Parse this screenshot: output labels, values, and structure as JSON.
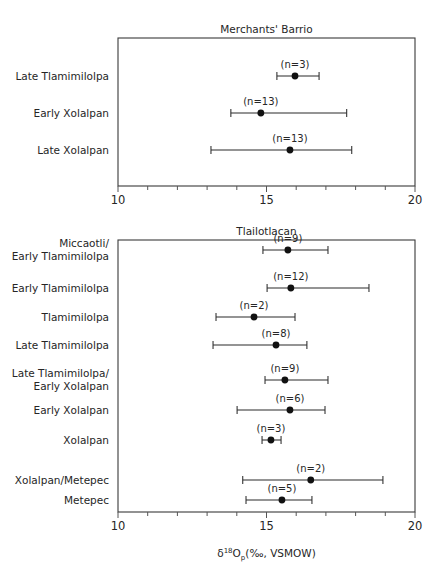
{
  "figure": {
    "axis_title_main": "O",
    "axis_title_delta": "δ",
    "axis_title_sup": "18",
    "axis_title_sub": "p",
    "axis_title_tail": "(‰, VSMOW)"
  },
  "chart_data": {
    "type": "scatter",
    "title": "",
    "xlabel": "δ18Op(‰, VSMOW)",
    "ylabel": "",
    "xlim": [
      10,
      20
    ],
    "xticks": [
      10,
      15,
      20
    ],
    "xtick_labels": [
      "10",
      "15",
      "20"
    ],
    "grid": false,
    "legend": "none",
    "orientation": "horizontal-error-bars",
    "panels": [
      {
        "name": "panel-merchants-barrio",
        "title": "Merchants' Barrio",
        "categories": [
          {
            "label": "Late Tlamimilolpa",
            "label_lines": [
              "Late Tlamimilolpa"
            ],
            "n": 3,
            "n_label": "(n=3)",
            "mean": 15.96,
            "low": 15.35,
            "high": 16.77
          },
          {
            "label": "Early Xolalpan",
            "label_lines": [
              "Early Xolalpan"
            ],
            "n": 13,
            "n_label": "(n=13)",
            "mean": 14.81,
            "low": 13.8,
            "high": 17.7
          },
          {
            "label": "Late Xolalpan",
            "label_lines": [
              "Late Xolalpan"
            ],
            "n": 13,
            "n_label": "(n=13)",
            "mean": 15.79,
            "low": 13.13,
            "high": 17.87
          }
        ]
      },
      {
        "name": "panel-tlailotlacan",
        "title": "Tlailotlacan",
        "categories": [
          {
            "label": "Miccaotli/Early Tlamimilolpa",
            "label_lines": [
              "Miccaotli/",
              "Early Tlamimilolpa"
            ],
            "n": 9,
            "n_label": "(n=9)",
            "mean": 15.72,
            "low": 14.88,
            "high": 17.07
          },
          {
            "label": "Early Tlamimilolpa",
            "label_lines": [
              "Early Tlamimilolpa"
            ],
            "n": 12,
            "n_label": "(n=12)",
            "mean": 15.82,
            "low": 15.02,
            "high": 18.45
          },
          {
            "label": "Tlamimilolpa",
            "label_lines": [
              "Tlamimilolpa"
            ],
            "n": 2,
            "n_label": "(n=2)",
            "mean": 14.58,
            "low": 13.3,
            "high": 15.96
          },
          {
            "label": "Late Tlamimilolpa",
            "label_lines": [
              "Late Tlamimilolpa"
            ],
            "n": 8,
            "n_label": "(n=8)",
            "mean": 15.32,
            "low": 13.2,
            "high": 16.36
          },
          {
            "label": "Late Tlamimilolpa/Early Xolalpan",
            "label_lines": [
              "Late Tlamimilolpa/",
              "Early Xolalpan"
            ],
            "n": 9,
            "n_label": "(n=9)",
            "mean": 15.62,
            "low": 14.95,
            "high": 17.07
          },
          {
            "label": "Early Xolalpan",
            "label_lines": [
              "Early Xolalpan"
            ],
            "n": 6,
            "n_label": "(n=6)",
            "mean": 15.79,
            "low": 14.01,
            "high": 16.97
          },
          {
            "label": "Xolalpan",
            "label_lines": [
              "Xolalpan"
            ],
            "n": 3,
            "n_label": "(n=3)",
            "mean": 15.15,
            "low": 14.85,
            "high": 15.49
          },
          {
            "label": "Xolalpan/Metepec",
            "label_lines": [
              "Xolalpan/Metepec"
            ],
            "n": 2,
            "n_label": "(n=2)",
            "mean": 16.49,
            "low": 14.2,
            "high": 18.92
          },
          {
            "label": "Metepec",
            "label_lines": [
              "Metepec"
            ],
            "n": 5,
            "n_label": "(n=5)",
            "mean": 15.52,
            "low": 14.31,
            "high": 16.53
          }
        ]
      }
    ]
  }
}
